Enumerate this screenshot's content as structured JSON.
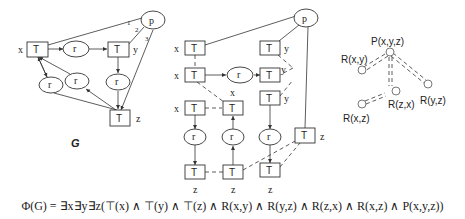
{
  "left_graph": {
    "title": "G",
    "p_label": "p",
    "t_label": "T",
    "r_label": "r",
    "vars": {
      "x": "x",
      "y": "y",
      "z": "z"
    },
    "edge_numbers": [
      "1",
      "2",
      "3"
    ]
  },
  "middle_graph": {
    "p_label": "p",
    "t_label": "T",
    "r_label": "r",
    "vars": {
      "x": "x",
      "y": "y",
      "z": "z"
    }
  },
  "right_tree": {
    "root": "P(x,y,z)",
    "children": [
      "R(x,y)",
      "R(z,x)",
      "R(y,z)"
    ],
    "grandchild": "R(x,z)"
  },
  "formula": "Φ(G) = ∃x∃y∃z(⊤(x) ∧ ⊤(y) ∧ ⊤(z) ∧ R(x,y) ∧ R(y,z) ∧ R(z,x) ∧ R(x,z) ∧ P(x,y,z))"
}
